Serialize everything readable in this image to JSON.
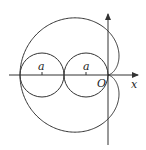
{
  "diagram": {
    "type": "polar-curve",
    "labels": {
      "origin": "O",
      "x_axis": "x",
      "left_circle_radius": "a",
      "right_circle_radius": "a"
    },
    "colors": {
      "stroke": "#333333",
      "background": "#ffffff"
    }
  }
}
